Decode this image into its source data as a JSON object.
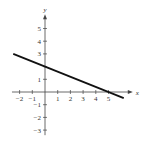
{
  "chart_data": {
    "type": "line",
    "title": "",
    "xlabel": "x",
    "ylabel": "y",
    "xlim": [
      -2.5,
      6.5
    ],
    "ylim": [
      -3.5,
      6
    ],
    "x_ticks": [
      -2,
      -1,
      1,
      2,
      3,
      4,
      5
    ],
    "y_ticks": [
      -3,
      -2,
      -1,
      1,
      2,
      3,
      4,
      5
    ],
    "x_tick_labels": [
      "−2",
      "−1",
      "1",
      "2",
      "3",
      "4",
      "5"
    ],
    "y_tick_labels": [
      "−3",
      "−2",
      "−1",
      "1",
      "3",
      "4",
      "5"
    ],
    "grid": false,
    "series": [
      {
        "name": "line",
        "equation": "y = 2 - 0.4x",
        "x": [
          -2.5,
          6.2
        ],
        "y": [
          3,
          -0.48
        ],
        "color": "#111111"
      }
    ],
    "intercepts": {
      "x": 5,
      "y": 2
    }
  }
}
